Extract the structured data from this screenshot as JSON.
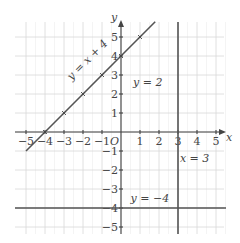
{
  "chart_data": {
    "type": "line",
    "title": "",
    "xlabel": "x",
    "ylabel": "y",
    "origin_label": "O",
    "xlim": [
      -5.5,
      5.5
    ],
    "ylim": [
      -5.5,
      5.5
    ],
    "grid": true,
    "x_ticks": [
      -5,
      -4,
      -3,
      -2,
      -1,
      1,
      2,
      3,
      4,
      5
    ],
    "y_ticks": [
      -5,
      -4,
      -3,
      -2,
      -1,
      1,
      2,
      3,
      4,
      5
    ],
    "x_tick_labels": [
      "−5",
      "−4",
      "−3",
      "−2",
      "−1",
      "1",
      "2",
      "3",
      "4",
      "5"
    ],
    "y_tick_labels": [
      "−5",
      "−4",
      "−3",
      "−2",
      "−1",
      "1",
      "2",
      "3",
      "4",
      "5"
    ],
    "series": [
      {
        "name": "y = x + 4",
        "kind": "sloped",
        "slope": 1,
        "intercept": 4,
        "x_range": [
          -5,
          1.8
        ],
        "marked_points": [
          [
            -4,
            0
          ],
          [
            -3,
            1
          ],
          [
            -2,
            2
          ],
          [
            -1,
            3
          ],
          [
            0,
            4
          ],
          [
            1,
            5
          ]
        ],
        "label": "y = x + 4"
      },
      {
        "name": "x = 3",
        "kind": "vertical",
        "x": 3,
        "label": "x = 3"
      },
      {
        "name": "y = −4",
        "kind": "horizontal",
        "y": -4,
        "label": "y = −4"
      }
    ],
    "annotations": [
      {
        "text": "y = 2",
        "at": [
          2,
          2.4
        ]
      }
    ]
  }
}
